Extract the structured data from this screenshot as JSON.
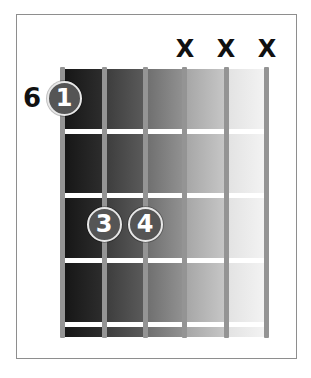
{
  "diagram": {
    "type": "guitar-chord-diagram",
    "starting_fret_label": "6",
    "strings_count": 6,
    "frets_shown": 4,
    "string_markers": [
      {
        "string": 1,
        "marker": ""
      },
      {
        "string": 2,
        "marker": ""
      },
      {
        "string": 3,
        "marker": ""
      },
      {
        "string": 4,
        "marker": "X"
      },
      {
        "string": 5,
        "marker": "X"
      },
      {
        "string": 6,
        "marker": "X"
      }
    ],
    "fingers": [
      {
        "finger": "1",
        "string": 1,
        "fret": 1
      },
      {
        "finger": "3",
        "string": 2,
        "fret": 3
      },
      {
        "finger": "4",
        "string": 3,
        "fret": 3
      }
    ],
    "colors": {
      "frame": "#8e8e8e",
      "string": "#949494",
      "fret": "#ffffff",
      "finger_fill": "#555555",
      "finger_text": "#ffffff",
      "mute_marker": "#111111",
      "fretboard_gradient": [
        "#1e1e1e",
        "#4a4a4a",
        "#7c7c7c",
        "#b2b2b2",
        "#ececec"
      ]
    }
  }
}
